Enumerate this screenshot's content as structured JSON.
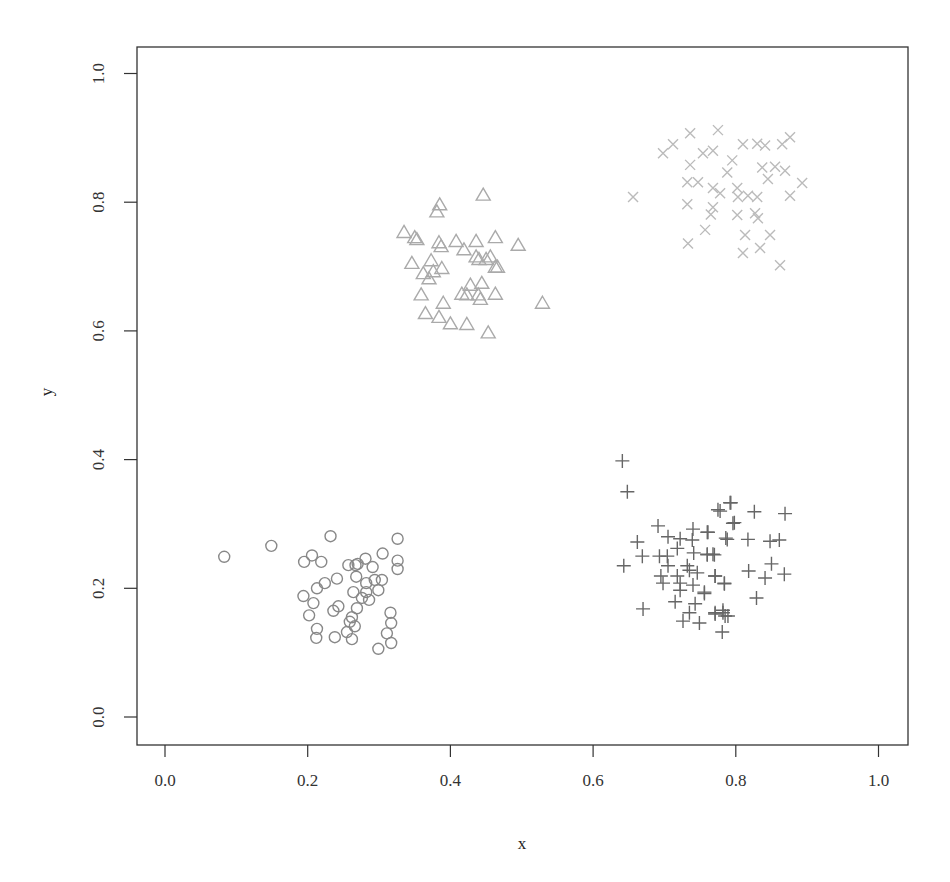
{
  "chart_data": {
    "type": "scatter",
    "title": "",
    "xlabel": "x",
    "ylabel": "y",
    "xlim": [
      -0.04,
      1.04
    ],
    "ylim": [
      -0.04,
      1.04
    ],
    "xticks": [
      "0.0",
      "0.2",
      "0.4",
      "0.6",
      "0.8",
      "1.0"
    ],
    "yticks": [
      "0.0",
      "0.2",
      "0.4",
      "0.6",
      "0.8",
      "1.0"
    ],
    "grid": false,
    "legend": null,
    "series": [
      {
        "name": "cluster-circles",
        "marker": "circle",
        "color": "#888888",
        "points": [
          [
            0.083,
            0.249
          ],
          [
            0.149,
            0.266
          ],
          [
            0.232,
            0.281
          ],
          [
            0.326,
            0.277
          ],
          [
            0.206,
            0.251
          ],
          [
            0.195,
            0.241
          ],
          [
            0.219,
            0.241
          ],
          [
            0.305,
            0.254
          ],
          [
            0.326,
            0.243
          ],
          [
            0.326,
            0.23
          ],
          [
            0.257,
            0.236
          ],
          [
            0.27,
            0.238
          ],
          [
            0.281,
            0.246
          ],
          [
            0.291,
            0.233
          ],
          [
            0.267,
            0.236
          ],
          [
            0.268,
            0.218
          ],
          [
            0.241,
            0.215
          ],
          [
            0.224,
            0.208
          ],
          [
            0.213,
            0.2
          ],
          [
            0.282,
            0.208
          ],
          [
            0.294,
            0.213
          ],
          [
            0.304,
            0.213
          ],
          [
            0.299,
            0.197
          ],
          [
            0.264,
            0.194
          ],
          [
            0.282,
            0.194
          ],
          [
            0.276,
            0.185
          ],
          [
            0.286,
            0.182
          ],
          [
            0.194,
            0.188
          ],
          [
            0.208,
            0.177
          ],
          [
            0.243,
            0.172
          ],
          [
            0.236,
            0.165
          ],
          [
            0.269,
            0.169
          ],
          [
            0.316,
            0.162
          ],
          [
            0.202,
            0.158
          ],
          [
            0.262,
            0.155
          ],
          [
            0.259,
            0.148
          ],
          [
            0.266,
            0.141
          ],
          [
            0.317,
            0.146
          ],
          [
            0.213,
            0.137
          ],
          [
            0.212,
            0.123
          ],
          [
            0.255,
            0.132
          ],
          [
            0.238,
            0.124
          ],
          [
            0.262,
            0.121
          ],
          [
            0.311,
            0.13
          ],
          [
            0.317,
            0.115
          ],
          [
            0.299,
            0.106
          ]
        ]
      },
      {
        "name": "cluster-plus",
        "marker": "plus",
        "color": "#666666",
        "points": [
          [
            0.641,
            0.398
          ],
          [
            0.648,
            0.35
          ],
          [
            0.792,
            0.333
          ],
          [
            0.775,
            0.322
          ],
          [
            0.796,
            0.301
          ],
          [
            0.691,
            0.297
          ],
          [
            0.74,
            0.292
          ],
          [
            0.76,
            0.287
          ],
          [
            0.705,
            0.28
          ],
          [
            0.722,
            0.277
          ],
          [
            0.739,
            0.275
          ],
          [
            0.786,
            0.278
          ],
          [
            0.662,
            0.272
          ],
          [
            0.718,
            0.262
          ],
          [
            0.669,
            0.25
          ],
          [
            0.693,
            0.25
          ],
          [
            0.704,
            0.25
          ],
          [
            0.741,
            0.255
          ],
          [
            0.76,
            0.252
          ],
          [
            0.77,
            0.252
          ],
          [
            0.643,
            0.235
          ],
          [
            0.705,
            0.235
          ],
          [
            0.732,
            0.235
          ],
          [
            0.735,
            0.228
          ],
          [
            0.746,
            0.224
          ],
          [
            0.695,
            0.219
          ],
          [
            0.718,
            0.219
          ],
          [
            0.771,
            0.219
          ],
          [
            0.698,
            0.208
          ],
          [
            0.722,
            0.208
          ],
          [
            0.74,
            0.205
          ],
          [
            0.784,
            0.207
          ],
          [
            0.722,
            0.197
          ],
          [
            0.756,
            0.192
          ],
          [
            0.715,
            0.179
          ],
          [
            0.743,
            0.176
          ],
          [
            0.67,
            0.168
          ],
          [
            0.735,
            0.162
          ],
          [
            0.771,
            0.162
          ],
          [
            0.782,
            0.166
          ],
          [
            0.785,
            0.157
          ],
          [
            0.726,
            0.149
          ],
          [
            0.749,
            0.146
          ],
          [
            0.793,
            0.333
          ],
          [
            0.778,
            0.32
          ],
          [
            0.826,
            0.319
          ],
          [
            0.869,
            0.316
          ],
          [
            0.798,
            0.302
          ],
          [
            0.761,
            0.287
          ],
          [
            0.788,
            0.276
          ],
          [
            0.817,
            0.276
          ],
          [
            0.848,
            0.273
          ],
          [
            0.861,
            0.275
          ],
          [
            0.76,
            0.253
          ],
          [
            0.768,
            0.253
          ],
          [
            0.818,
            0.227
          ],
          [
            0.85,
            0.238
          ],
          [
            0.841,
            0.216
          ],
          [
            0.868,
            0.222
          ],
          [
            0.771,
            0.219
          ],
          [
            0.784,
            0.208
          ],
          [
            0.756,
            0.194
          ],
          [
            0.829,
            0.185
          ],
          [
            0.771,
            0.16
          ],
          [
            0.782,
            0.162
          ],
          [
            0.789,
            0.157
          ],
          [
            0.781,
            0.132
          ]
        ]
      },
      {
        "name": "cluster-triangles",
        "marker": "triangle",
        "color": "#aaaaaa",
        "points": [
          [
            0.446,
            0.811
          ],
          [
            0.385,
            0.796
          ],
          [
            0.381,
            0.785
          ],
          [
            0.335,
            0.753
          ],
          [
            0.35,
            0.745
          ],
          [
            0.353,
            0.742
          ],
          [
            0.384,
            0.737
          ],
          [
            0.387,
            0.731
          ],
          [
            0.408,
            0.739
          ],
          [
            0.436,
            0.739
          ],
          [
            0.463,
            0.745
          ],
          [
            0.495,
            0.733
          ],
          [
            0.419,
            0.726
          ],
          [
            0.436,
            0.715
          ],
          [
            0.44,
            0.711
          ],
          [
            0.45,
            0.711
          ],
          [
            0.456,
            0.715
          ],
          [
            0.463,
            0.699
          ],
          [
            0.466,
            0.699
          ],
          [
            0.346,
            0.705
          ],
          [
            0.373,
            0.709
          ],
          [
            0.362,
            0.689
          ],
          [
            0.376,
            0.692
          ],
          [
            0.388,
            0.697
          ],
          [
            0.37,
            0.681
          ],
          [
            0.428,
            0.671
          ],
          [
            0.444,
            0.674
          ],
          [
            0.416,
            0.657
          ],
          [
            0.423,
            0.656
          ],
          [
            0.439,
            0.656
          ],
          [
            0.442,
            0.649
          ],
          [
            0.463,
            0.657
          ],
          [
            0.359,
            0.656
          ],
          [
            0.39,
            0.643
          ],
          [
            0.529,
            0.643
          ],
          [
            0.365,
            0.627
          ],
          [
            0.384,
            0.621
          ],
          [
            0.4,
            0.611
          ],
          [
            0.423,
            0.61
          ],
          [
            0.453,
            0.597
          ]
        ]
      },
      {
        "name": "cluster-x",
        "marker": "x",
        "color": "#bbbbbb",
        "points": [
          [
            0.736,
            0.907
          ],
          [
            0.775,
            0.912
          ],
          [
            0.712,
            0.89
          ],
          [
            0.698,
            0.876
          ],
          [
            0.754,
            0.876
          ],
          [
            0.768,
            0.88
          ],
          [
            0.81,
            0.89
          ],
          [
            0.83,
            0.891
          ],
          [
            0.841,
            0.888
          ],
          [
            0.865,
            0.89
          ],
          [
            0.876,
            0.901
          ],
          [
            0.795,
            0.865
          ],
          [
            0.736,
            0.858
          ],
          [
            0.788,
            0.846
          ],
          [
            0.837,
            0.854
          ],
          [
            0.855,
            0.855
          ],
          [
            0.869,
            0.849
          ],
          [
            0.732,
            0.831
          ],
          [
            0.747,
            0.831
          ],
          [
            0.768,
            0.822
          ],
          [
            0.778,
            0.814
          ],
          [
            0.802,
            0.822
          ],
          [
            0.845,
            0.836
          ],
          [
            0.893,
            0.83
          ],
          [
            0.656,
            0.808
          ],
          [
            0.803,
            0.808
          ],
          [
            0.817,
            0.81
          ],
          [
            0.83,
            0.808
          ],
          [
            0.876,
            0.81
          ],
          [
            0.732,
            0.797
          ],
          [
            0.768,
            0.792
          ],
          [
            0.765,
            0.781
          ],
          [
            0.827,
            0.783
          ],
          [
            0.802,
            0.78
          ],
          [
            0.831,
            0.775
          ],
          [
            0.757,
            0.757
          ],
          [
            0.813,
            0.749
          ],
          [
            0.848,
            0.749
          ],
          [
            0.733,
            0.736
          ],
          [
            0.81,
            0.721
          ],
          [
            0.834,
            0.729
          ],
          [
            0.862,
            0.702
          ]
        ]
      }
    ]
  }
}
